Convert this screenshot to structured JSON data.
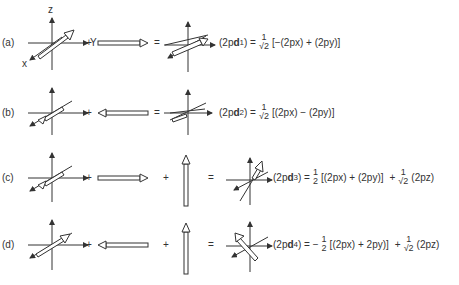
{
  "axis_labels": {
    "x": "x",
    "y": "Y",
    "z": "z"
  },
  "operators": {
    "plus": "+",
    "equals": "="
  },
  "rows": [
    {
      "label": "(a)",
      "lhs": "(2p",
      "d_bold": "d",
      "sub": "1",
      "eq_sign": ") =",
      "terms": [
        {
          "coef_num": "1",
          "coef_den": "√2",
          "expr": "[−(2px) + (2py)]"
        }
      ]
    },
    {
      "label": "(b)",
      "lhs": "(2p",
      "d_bold": "d",
      "sub": "2",
      "eq_sign": ") =",
      "terms": [
        {
          "coef_num": "1",
          "coef_den": "√2",
          "expr": "[(2px) − (2py)]"
        }
      ]
    },
    {
      "label": "(c)",
      "lhs": "(2p",
      "d_bold": "d",
      "sub": "3",
      "eq_sign": ") =",
      "terms": [
        {
          "coef_num": "1",
          "coef_den": "2",
          "expr": "[(2px) + (2py)]",
          "sign": ""
        },
        {
          "coef_num": "1",
          "coef_den": "√2",
          "expr": "(2pz)",
          "sign": "+"
        }
      ]
    },
    {
      "label": "(d)",
      "lhs": "(2p",
      "d_bold": "d",
      "sub": "4",
      "eq_sign": ") = −",
      "terms": [
        {
          "coef_num": "1",
          "coef_den": "2",
          "expr": "[(2px) + 2py)]",
          "sign": ""
        },
        {
          "coef_num": "1",
          "coef_den": "√2",
          "expr": "(2pz)",
          "sign": "+"
        }
      ]
    }
  ]
}
